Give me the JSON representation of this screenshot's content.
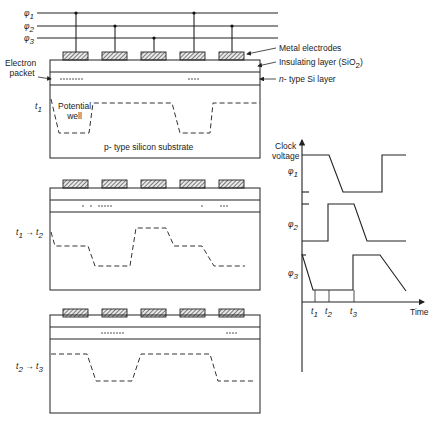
{
  "clock_lines": [
    {
      "label": "φ",
      "sub": "1",
      "y": 13
    },
    {
      "label": "φ",
      "sub": "2",
      "y": 26
    },
    {
      "label": "φ",
      "sub": "3",
      "y": 38
    }
  ],
  "electrodes": [
    {
      "x": 63,
      "phase": 1
    },
    {
      "x": 102,
      "phase": 2
    },
    {
      "x": 141,
      "phase": 3
    },
    {
      "x": 180,
      "phase": 1
    },
    {
      "x": 219,
      "phase": 2
    }
  ],
  "annotations": {
    "metal_electrodes": "Metal electrodes",
    "insulating_layer": "Insulating layer (SiO",
    "insulating_sub": "2",
    "insulating_close": ")",
    "n_layer_italic": "n",
    "n_layer": "- type Si layer",
    "electron_packet_line1": "Electron",
    "electron_packet_line2": "packet",
    "potential_well_line1": "Potential",
    "potential_well_line2": "well",
    "substrate": "p- type silicon substrate"
  },
  "panels": [
    {
      "name": "t1",
      "time_label": "t",
      "time_sub": "1",
      "time_label_end": "",
      "time_sub_end": "",
      "electrons": "•••••••  ••••",
      "potential_profile": "wells under electrodes 1 and 4 (phi1)"
    },
    {
      "name": "t1-to-t2",
      "time_label": "t",
      "time_sub": "1",
      "time_label_end": "t",
      "time_sub_end": "2",
      "arrow": "→",
      "electrons": "• • •••••  • •••",
      "potential_profile": "transfer from phi1 to phi2 electrodes"
    },
    {
      "name": "t2-to-t3",
      "time_label": "t",
      "time_sub": "2",
      "time_label_end": "t",
      "time_sub_end": "3",
      "arrow": "→",
      "electrons": "•••••••  ••••",
      "potential_profile": "wells under electrodes 2 and 5 (phi2)"
    }
  ],
  "timing_chart": {
    "ylabel_line1": "Clock",
    "ylabel_line2": "voltage",
    "xlabel": "Time",
    "phases": [
      {
        "label": "φ",
        "sub": "1"
      },
      {
        "label": "φ",
        "sub": "2"
      },
      {
        "label": "φ",
        "sub": "3"
      }
    ],
    "ticks": [
      {
        "label": "t",
        "sub": "1"
      },
      {
        "label": "t",
        "sub": "2"
      },
      {
        "label": "t",
        "sub": "3"
      }
    ]
  }
}
